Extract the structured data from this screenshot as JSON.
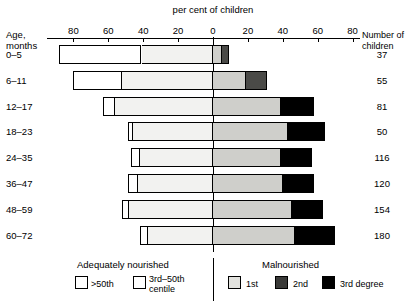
{
  "chart_data": {
    "type": "bar",
    "subtype": "diverging-horizontal-stacked",
    "title": "per cent of children",
    "xlabel": "per cent of children",
    "ylabel": "Age, months",
    "right_axis_label": "Number of children",
    "xlim": [
      -95,
      95
    ],
    "xticks": [
      -80,
      -60,
      -40,
      -20,
      0,
      20,
      40,
      60,
      80
    ],
    "xticklabels": [
      "80",
      "60",
      "40",
      "20",
      "0",
      "20",
      "40",
      "60",
      "80"
    ],
    "grid": false,
    "legend_position": "bottom",
    "categories": [
      "0–5",
      "6–11",
      "12–17",
      "18–23",
      "24–35",
      "36–47",
      "48–59",
      "60–72"
    ],
    "counts": [
      37,
      55,
      81,
      50,
      116,
      120,
      154,
      180
    ],
    "series": [
      {
        "name": ">50th",
        "side": "left",
        "values": [
          47,
          28,
          7,
          3,
          5,
          6,
          4,
          5
        ]
      },
      {
        "name": "3rd–50th centile",
        "side": "left",
        "values": [
          41,
          52,
          56,
          46,
          42,
          43,
          48,
          37
        ]
      },
      {
        "name": "1st",
        "side": "right",
        "values": [
          5,
          19,
          39,
          43,
          39,
          40,
          45,
          47
        ]
      },
      {
        "name": "2nd",
        "side": "right",
        "values": [
          4,
          12,
          0,
          0,
          0,
          0,
          0,
          0
        ]
      },
      {
        "name": "3rd degree",
        "side": "right",
        "values": [
          0,
          0,
          19,
          21,
          18,
          18,
          18,
          23
        ]
      }
    ],
    "legend_groups": [
      {
        "label": "Adequately nourished",
        "entries": [
          "&gt;50th",
          "3rd–50th centile"
        ]
      },
      {
        "label": "Malnourished",
        "entries": [
          "1st",
          "2nd",
          "3rd degree"
        ]
      }
    ]
  },
  "axis": {
    "title": "per cent of children",
    "age_label_line1": "Age,",
    "age_label_line2": "months",
    "right_label_line1": "Number of",
    "right_label_line2": "children",
    "ticks": [
      {
        "value": -80,
        "label": "80"
      },
      {
        "value": -60,
        "label": "60"
      },
      {
        "value": -40,
        "label": "40"
      },
      {
        "value": -20,
        "label": "20"
      },
      {
        "value": 0,
        "label": "0"
      },
      {
        "value": 20,
        "label": "20"
      },
      {
        "value": 40,
        "label": "40"
      },
      {
        "value": 60,
        "label": "60"
      },
      {
        "value": 80,
        "label": "80"
      }
    ]
  },
  "rows": [
    {
      "age": "0–5",
      "count": "37",
      "gt50": 47,
      "c350": 41,
      "d1": 5,
      "d2": 4,
      "d3": 0
    },
    {
      "age": "6–11",
      "count": "55",
      "gt50": 28,
      "c350": 52,
      "d1": 19,
      "d2": 12,
      "d3": 0
    },
    {
      "age": "12–17",
      "count": "81",
      "gt50": 7,
      "c350": 56,
      "d1": 39,
      "d2": 0,
      "d3": 19
    },
    {
      "age": "18–23",
      "count": "50",
      "gt50": 3,
      "c350": 46,
      "d1": 43,
      "d2": 0,
      "d3": 21
    },
    {
      "age": "24–35",
      "count": "116",
      "gt50": 5,
      "c350": 42,
      "d1": 39,
      "d2": 0,
      "d3": 18
    },
    {
      "age": "36–47",
      "count": "120",
      "gt50": 6,
      "c350": 43,
      "d1": 40,
      "d2": 0,
      "d3": 18
    },
    {
      "age": "48–59",
      "count": "154",
      "gt50": 4,
      "c350": 48,
      "d1": 45,
      "d2": 0,
      "d3": 18
    },
    {
      "age": "60–72",
      "count": "180",
      "gt50": 5,
      "c350": 37,
      "d1": 47,
      "d2": 0,
      "d3": 23
    }
  ],
  "legend": {
    "left_title": "Adequately nourished",
    "right_title": "Malnourished",
    "gt50": ">50th",
    "c350_line1": "3rd–50th",
    "c350_line2": "centile",
    "deg1": "1st",
    "deg2": "2nd",
    "deg3": "3rd degree"
  }
}
